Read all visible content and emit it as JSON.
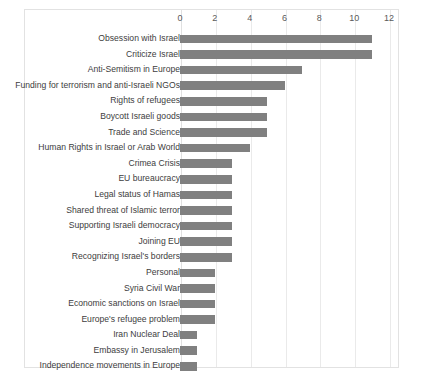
{
  "chart_data": {
    "type": "bar",
    "orientation": "horizontal",
    "title": "",
    "subtitle": "",
    "xlabel": "",
    "ylabel": "",
    "xlim": [
      0,
      12
    ],
    "ylim": null,
    "grid": true,
    "legend": null,
    "legend_position": "none",
    "xticks": [
      0,
      2,
      4,
      6,
      8,
      10,
      12
    ],
    "xtick_labels": [
      "0",
      "2",
      "4",
      "6",
      "8",
      "10",
      "12"
    ],
    "gridline_values": [
      0,
      2,
      4,
      6,
      8,
      10,
      12
    ],
    "bar_color": "#808080",
    "plot_border_color": "#e2e2e2",
    "gridline_color": "#eaeaea",
    "categories": [
      "Obsession with Israel",
      "Criticize Israel",
      "Anti-Semitism in Europe",
      "Funding for terrorism and anti-Israeli NGOs",
      "Rights of refugees",
      "Boycott Israeli goods",
      "Trade and Science",
      "Human Rights in Israel or Arab World",
      "Crimea Crisis",
      "EU bureaucracy",
      "Legal status of Hamas",
      "Shared threat of Islamic terror",
      "Supporting Israeli democracy",
      "Joining EU",
      "Recognizing Israel's borders",
      "Personal",
      "Syria Civil War",
      "Economic sanctions on Israel",
      "Europe's refugee problem",
      "Iran Nuclear Deal",
      "Embassy in Jerusalem",
      "Independence movements in Europe"
    ],
    "values": [
      11,
      11,
      7,
      6,
      5,
      5,
      5,
      4,
      3,
      3,
      3,
      3,
      3,
      3,
      3,
      2,
      2,
      2,
      2,
      1,
      1,
      1
    ]
  }
}
